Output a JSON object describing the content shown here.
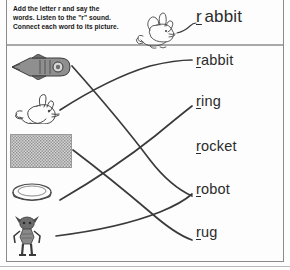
{
  "worksheet": {
    "instructions": [
      "Add the letter r and say the",
      "words. Listen to the \"r\" sound.",
      "Connect each word to its picture."
    ],
    "example": {
      "letter": "r",
      "rest": "abbit",
      "picture": "rabbit-drawing",
      "connector": "curved-line"
    },
    "target_letter": "r",
    "pictures": [
      {
        "name": "rocket-picture",
        "label": "rocket"
      },
      {
        "name": "rabbit-picture",
        "label": "rabbit"
      },
      {
        "name": "rug-picture",
        "label": "rug"
      },
      {
        "name": "ring-picture",
        "label": "ring"
      },
      {
        "name": "robot-picture",
        "label": "robot"
      }
    ],
    "words": [
      {
        "letter": "r",
        "rest": "abbit",
        "full": "rabbit"
      },
      {
        "letter": "r",
        "rest": "ing",
        "full": "ring"
      },
      {
        "letter": "r",
        "rest": "ocket",
        "full": "rocket"
      },
      {
        "letter": "r",
        "rest": "obot",
        "full": "robot"
      },
      {
        "letter": "r",
        "rest": "ug",
        "full": "rug"
      }
    ],
    "connections": [
      {
        "from": "rocket-picture",
        "to": "rocket"
      },
      {
        "from": "rabbit-picture",
        "to": "rabbit"
      },
      {
        "from": "rug-picture",
        "to": "rug"
      },
      {
        "from": "ring-picture",
        "to": "ring"
      },
      {
        "from": "robot-picture",
        "to": "robot"
      }
    ],
    "colors": {
      "ink": "#2b2b2b",
      "line": "#3a3a3a",
      "border": "#8a8a8a",
      "paper": "#fdfdfd"
    }
  }
}
